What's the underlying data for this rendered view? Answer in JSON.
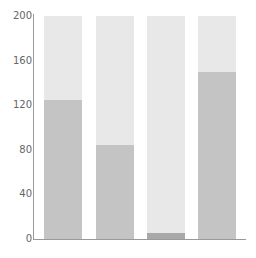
{
  "chart_data": {
    "type": "bar",
    "title": "",
    "xlabel": "",
    "ylabel": "",
    "categories": [
      "1",
      "2",
      "3",
      "4"
    ],
    "values": [
      125,
      84,
      5,
      150
    ],
    "capacity": 200,
    "ylim": [
      0,
      200
    ],
    "yticks": [
      0,
      40,
      80,
      120,
      160,
      200
    ],
    "grid": false,
    "legend": null,
    "colors": {
      "background_bar": "#e8e8e8",
      "value_bar": "#c4c4c4",
      "value_bar_low": "#a8a8a8",
      "axis": "#999999",
      "tick_text": "#666666"
    }
  }
}
